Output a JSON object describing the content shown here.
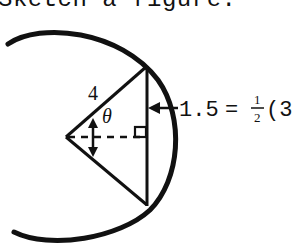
{
  "caption": "Sketch a figure.",
  "figure": {
    "radius_label": "4",
    "angle_label": "θ",
    "distance_label": "1.5",
    "equation_equals": "=",
    "fraction_numerator": "1",
    "fraction_denominator": "2",
    "equation_tail": "(3",
    "stroke_color": "#111111",
    "background_color": "#ffffff"
  }
}
